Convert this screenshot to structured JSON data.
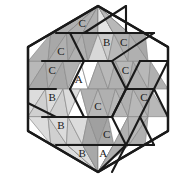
{
  "figure": {
    "name": "hexagon-triangular-tiling",
    "background": "#ffffff",
    "outline_color": "#1a1a1a",
    "grid_line_color": "#8a8a8a",
    "label_color": "#1a1a1a"
  },
  "palette": {
    "white": "#ffffff",
    "very_light": "#f0f0f0",
    "light": "#dcdcdc",
    "light_mid": "#d0d0d0",
    "mid": "#bcbcbc",
    "mid_dark": "#b0b0b0",
    "dark": "#a0a0a0"
  },
  "geometry": {
    "center_x": 98,
    "center_y": 89,
    "half_width": 84,
    "half_height": 83,
    "rows": 6,
    "row_height": 27.6667,
    "cell_half_width": 14,
    "row_triangle_counts": [
      6,
      8,
      10,
      10,
      8,
      6
    ]
  },
  "hexagon_outline": "98,6 168,47 168,131 98,172 28,131 28,47",
  "triangles": [
    {
      "id": "r0c0",
      "row": 0,
      "col": 0,
      "dir": "up",
      "fill": "#b0b0b0",
      "label": ""
    },
    {
      "id": "r0c1",
      "row": 0,
      "col": 1,
      "dir": "down",
      "fill": "#a8a8a8",
      "label": ""
    },
    {
      "id": "r0c2",
      "row": 0,
      "col": 2,
      "dir": "up",
      "fill": "#b0b0b0",
      "label": "C"
    },
    {
      "id": "r0c3",
      "row": 0,
      "col": 3,
      "dir": "down",
      "fill": "#a8a8a8",
      "label": ""
    },
    {
      "id": "r0c4",
      "row": 0,
      "col": 4,
      "dir": "up",
      "fill": "#b0b0b0",
      "label": ""
    },
    {
      "id": "r0c5",
      "row": 0,
      "col": 5,
      "dir": "down",
      "fill": "#d8d8d8",
      "label": ""
    },
    {
      "id": "r0c6",
      "row": 0,
      "col": 6,
      "dir": "up",
      "fill": "#e4e4e4",
      "label": ""
    },
    {
      "id": "r0c7",
      "row": 0,
      "col": 7,
      "dir": "down",
      "fill": "#cccccc",
      "label": ""
    },
    {
      "id": "r0c8",
      "row": 0,
      "col": 8,
      "dir": "up",
      "fill": "#b8b8b8",
      "label": ""
    },
    {
      "id": "r0c9",
      "row": 0,
      "col": 9,
      "dir": "down",
      "fill": "#b0b0b0",
      "label": ""
    },
    {
      "id": "r1c0",
      "row": 1,
      "col": 0,
      "dir": "up",
      "fill": "#b0b0b0",
      "label": ""
    },
    {
      "id": "r1c1",
      "row": 1,
      "col": 1,
      "dir": "down",
      "fill": "#a8a8a8",
      "label": ""
    },
    {
      "id": "r1c2",
      "row": 1,
      "col": 2,
      "dir": "up",
      "fill": "#b0b0b0",
      "label": "C"
    },
    {
      "id": "r1c3",
      "row": 1,
      "col": 3,
      "dir": "down",
      "fill": "#a8a8a8",
      "label": ""
    },
    {
      "id": "r1c4",
      "row": 1,
      "col": 4,
      "dir": "up",
      "fill": "#b0b0b0",
      "label": ""
    },
    {
      "id": "r1c5",
      "row": 1,
      "col": 5,
      "dir": "down",
      "fill": "#a8a8a8",
      "label": ""
    },
    {
      "id": "r1c6",
      "row": 1,
      "col": 6,
      "dir": "up",
      "fill": "#d8d8d8",
      "label": ""
    },
    {
      "id": "r1c7",
      "row": 1,
      "col": 7,
      "dir": "down",
      "fill": "#cccccc",
      "label": "B"
    },
    {
      "id": "r1c8",
      "row": 1,
      "col": 8,
      "dir": "up",
      "fill": "#b8b8b8",
      "label": ""
    },
    {
      "id": "r1c9",
      "row": 1,
      "col": 9,
      "dir": "down",
      "fill": "#b0b0b0",
      "label": "C"
    },
    {
      "id": "r1c10",
      "row": 1,
      "col": 10,
      "dir": "up",
      "fill": "#b0b0b0",
      "label": ""
    },
    {
      "id": "r1c11",
      "row": 1,
      "col": 11,
      "dir": "down",
      "fill": "#a8a8a8",
      "label": ""
    },
    {
      "id": "r2c0",
      "row": 2,
      "col": 0,
      "dir": "up",
      "fill": "#b8b8b8",
      "label": ""
    },
    {
      "id": "r2c1",
      "row": 2,
      "col": 1,
      "dir": "down",
      "fill": "#a8a8a8",
      "label": ""
    },
    {
      "id": "r2c2",
      "row": 2,
      "col": 2,
      "dir": "up",
      "fill": "#b0b0b0",
      "label": "C"
    },
    {
      "id": "r2c3",
      "row": 2,
      "col": 3,
      "dir": "down",
      "fill": "#a8a8a8",
      "label": ""
    },
    {
      "id": "r2c4",
      "row": 2,
      "col": 4,
      "dir": "up",
      "fill": "#b0b0b0",
      "label": ""
    },
    {
      "id": "r2c5",
      "row": 2,
      "col": 5,
      "dir": "down",
      "fill": "#ffffff",
      "label": "A"
    },
    {
      "id": "r2c6",
      "row": 2,
      "col": 6,
      "dir": "up",
      "fill": "#ffffff",
      "label": ""
    },
    {
      "id": "r2c7",
      "row": 2,
      "col": 7,
      "dir": "down",
      "fill": "#b0b0b0",
      "label": ""
    },
    {
      "id": "r2c8",
      "row": 2,
      "col": 8,
      "dir": "up",
      "fill": "#b8b8b8",
      "label": ""
    },
    {
      "id": "r2c9",
      "row": 2,
      "col": 9,
      "dir": "down",
      "fill": "#b0b0b0",
      "label": ""
    },
    {
      "id": "r2c10",
      "row": 2,
      "col": 10,
      "dir": "up",
      "fill": "#b8b8b8",
      "label": "C"
    },
    {
      "id": "r2c11",
      "row": 2,
      "col": 11,
      "dir": "down",
      "fill": "#b0b0b0",
      "label": ""
    },
    {
      "id": "r2c12",
      "row": 2,
      "col": 12,
      "dir": "up",
      "fill": "#b8b8b8",
      "label": ""
    },
    {
      "id": "r2c13",
      "row": 2,
      "col": 13,
      "dir": "down",
      "fill": "#b0b0b0",
      "label": ""
    },
    {
      "id": "r3c0",
      "row": 3,
      "col": 0,
      "dir": "up",
      "fill": "#dcdcdc",
      "label": ""
    },
    {
      "id": "r3c1",
      "row": 3,
      "col": 1,
      "dir": "down",
      "fill": "#d0d0d0",
      "label": ""
    },
    {
      "id": "r3c2",
      "row": 3,
      "col": 2,
      "dir": "up",
      "fill": "#dcdcdc",
      "label": "B"
    },
    {
      "id": "r3c3",
      "row": 3,
      "col": 3,
      "dir": "down",
      "fill": "#d0d0d0",
      "label": ""
    },
    {
      "id": "r3c4",
      "row": 3,
      "col": 4,
      "dir": "up",
      "fill": "#dcdcdc",
      "label": ""
    },
    {
      "id": "r3c5",
      "row": 3,
      "col": 5,
      "dir": "down",
      "fill": "#ffffff",
      "label": ""
    },
    {
      "id": "r3c6",
      "row": 3,
      "col": 6,
      "dir": "up",
      "fill": "#b0b0b0",
      "label": ""
    },
    {
      "id": "r3c7",
      "row": 3,
      "col": 7,
      "dir": "down",
      "fill": "#b8b8b8",
      "label": "C"
    },
    {
      "id": "r3c8",
      "row": 3,
      "col": 8,
      "dir": "up",
      "fill": "#b0b0b0",
      "label": ""
    },
    {
      "id": "r3c9",
      "row": 3,
      "col": 9,
      "dir": "down",
      "fill": "#b8b8b8",
      "label": ""
    },
    {
      "id": "r3c10",
      "row": 3,
      "col": 10,
      "dir": "up",
      "fill": "#b0b0b0",
      "label": ""
    },
    {
      "id": "r3c11",
      "row": 3,
      "col": 11,
      "dir": "down",
      "fill": "#b8b8b8",
      "label": ""
    },
    {
      "id": "r3c12",
      "row": 3,
      "col": 12,
      "dir": "up",
      "fill": "#b0b0b0",
      "label": "C"
    },
    {
      "id": "r3c13",
      "row": 3,
      "col": 13,
      "dir": "down",
      "fill": "#b8b8b8",
      "label": ""
    },
    {
      "id": "r4c0",
      "row": 4,
      "col": 0,
      "dir": "up",
      "fill": "#dcdcdc",
      "label": ""
    },
    {
      "id": "r4c1",
      "row": 4,
      "col": 1,
      "dir": "down",
      "fill": "#d0d0d0",
      "label": ""
    },
    {
      "id": "r4c2",
      "row": 4,
      "col": 2,
      "dir": "up",
      "fill": "#dcdcdc",
      "label": "B"
    },
    {
      "id": "r4c3",
      "row": 4,
      "col": 3,
      "dir": "down",
      "fill": "#d0d0d0",
      "label": ""
    },
    {
      "id": "r4c4",
      "row": 4,
      "col": 4,
      "dir": "up",
      "fill": "#dcdcdc",
      "label": ""
    },
    {
      "id": "r4c5",
      "row": 4,
      "col": 5,
      "dir": "down",
      "fill": "#a8a8a8",
      "label": ""
    },
    {
      "id": "r4c6",
      "row": 4,
      "col": 6,
      "dir": "up",
      "fill": "#a0a0a0",
      "label": ""
    },
    {
      "id": "r4c7",
      "row": 4,
      "col": 7,
      "dir": "down",
      "fill": "#a8a8a8",
      "label": "C"
    },
    {
      "id": "r4c8",
      "row": 4,
      "col": 8,
      "dir": "up",
      "fill": "#ffffff",
      "label": ""
    },
    {
      "id": "r4c9",
      "row": 4,
      "col": 9,
      "dir": "down",
      "fill": "#b0b0b0",
      "label": ""
    },
    {
      "id": "r4c10",
      "row": 4,
      "col": 10,
      "dir": "up",
      "fill": "#b8b8b8",
      "label": ""
    },
    {
      "id": "r4c11",
      "row": 4,
      "col": 11,
      "dir": "down",
      "fill": "#b0b0b0",
      "label": ""
    },
    {
      "id": "r5c0",
      "row": 5,
      "col": 0,
      "dir": "up",
      "fill": "#dcdcdc",
      "label": ""
    },
    {
      "id": "r5c1",
      "row": 5,
      "col": 1,
      "dir": "down",
      "fill": "#d0d0d0",
      "label": ""
    },
    {
      "id": "r5c2",
      "row": 5,
      "col": 2,
      "dir": "up",
      "fill": "#dcdcdc",
      "label": "B"
    },
    {
      "id": "r5c3",
      "row": 5,
      "col": 3,
      "dir": "down",
      "fill": "#d0d0d0",
      "label": ""
    },
    {
      "id": "r5c4",
      "row": 5,
      "col": 4,
      "dir": "up",
      "fill": "#a8a8a8",
      "label": ""
    },
    {
      "id": "r5c5",
      "row": 5,
      "col": 5,
      "dir": "down",
      "fill": "#a0a0a0",
      "label": ""
    },
    {
      "id": "r5c6",
      "row": 5,
      "col": 6,
      "dir": "up",
      "fill": "#ffffff",
      "label": "A"
    },
    {
      "id": "r5c7",
      "row": 5,
      "col": 7,
      "dir": "down",
      "fill": "#ffffff",
      "label": ""
    },
    {
      "id": "r5c8",
      "row": 5,
      "col": 8,
      "dir": "up",
      "fill": "#b0b0b0",
      "label": ""
    },
    {
      "id": "r5c9",
      "row": 5,
      "col": 9,
      "dir": "down",
      "fill": "#b8b8b8",
      "label": ""
    }
  ],
  "bold_edges": [
    {
      "id": "be01",
      "from": [
        98,
        6
      ],
      "to": [
        168,
        47
      ]
    },
    {
      "id": "be02",
      "from": [
        168,
        47
      ],
      "to": [
        168,
        131
      ]
    },
    {
      "id": "be03",
      "from": [
        168,
        131
      ],
      "to": [
        98,
        172
      ]
    },
    {
      "id": "be04",
      "from": [
        98,
        172
      ],
      "to": [
        28,
        131
      ]
    },
    {
      "id": "be05",
      "from": [
        28,
        131
      ],
      "to": [
        28,
        47
      ]
    },
    {
      "id": "be06",
      "from": [
        28,
        47
      ],
      "to": [
        98,
        6
      ]
    },
    {
      "id": "be10",
      "from": [
        56,
        33
      ],
      "to": [
        126,
        33
      ]
    },
    {
      "id": "be11",
      "from": [
        42,
        61
      ],
      "to": [
        112,
        61
      ]
    },
    {
      "id": "be12",
      "from": [
        28,
        89
      ],
      "to": [
        56,
        89
      ]
    },
    {
      "id": "be13",
      "from": [
        28,
        103
      ],
      "to": [
        28,
        47
      ]
    },
    {
      "id": "be20",
      "from": [
        126,
        6
      ],
      "to": [
        84,
        33
      ]
    },
    {
      "id": "be21",
      "from": [
        126,
        33
      ],
      "to": [
        126,
        6
      ]
    },
    {
      "id": "be22",
      "from": [
        112,
        61
      ],
      "to": [
        154,
        33
      ]
    },
    {
      "id": "be23",
      "from": [
        126,
        33
      ],
      "to": [
        154,
        33
      ]
    },
    {
      "id": "be30",
      "from": [
        112,
        61
      ],
      "to": [
        84,
        61
      ]
    },
    {
      "id": "be31",
      "from": [
        84,
        61
      ],
      "to": [
        70,
        89
      ]
    },
    {
      "id": "be32",
      "from": [
        70,
        89
      ],
      "to": [
        84,
        117
      ]
    },
    {
      "id": "be33",
      "from": [
        84,
        117
      ],
      "to": [
        112,
        117
      ]
    },
    {
      "id": "be34",
      "from": [
        112,
        117
      ],
      "to": [
        126,
        89
      ]
    },
    {
      "id": "be35",
      "from": [
        126,
        89
      ],
      "to": [
        112,
        61
      ]
    },
    {
      "id": "be40",
      "from": [
        140,
        61
      ],
      "to": [
        168,
        61
      ]
    },
    {
      "id": "be41",
      "from": [
        126,
        89
      ],
      "to": [
        154,
        89
      ]
    },
    {
      "id": "be42",
      "from": [
        154,
        89
      ],
      "to": [
        168,
        61
      ]
    },
    {
      "id": "be43",
      "from": [
        140,
        61
      ],
      "to": [
        126,
        89
      ]
    },
    {
      "id": "be44",
      "from": [
        154,
        89
      ],
      "to": [
        168,
        117
      ]
    },
    {
      "id": "be45",
      "from": [
        154,
        89
      ],
      "to": [
        140,
        117
      ]
    },
    {
      "id": "be46",
      "from": [
        140,
        117
      ],
      "to": [
        126,
        145
      ]
    },
    {
      "id": "be47",
      "from": [
        126,
        145
      ],
      "to": [
        112,
        117
      ]
    },
    {
      "id": "be48",
      "from": [
        112,
        117
      ],
      "to": [
        126,
        89
      ]
    },
    {
      "id": "be49",
      "from": [
        126,
        145
      ],
      "to": [
        112,
        172
      ]
    },
    {
      "id": "be50",
      "from": [
        140,
        117
      ],
      "to": [
        154,
        145
      ]
    },
    {
      "id": "be51",
      "from": [
        154,
        145
      ],
      "to": [
        126,
        145
      ]
    },
    {
      "id": "be60",
      "from": [
        28,
        103
      ],
      "to": [
        56,
        117
      ]
    },
    {
      "id": "be61",
      "from": [
        42,
        117
      ],
      "to": [
        112,
        117
      ]
    },
    {
      "id": "be62",
      "from": [
        56,
        145
      ],
      "to": [
        126,
        145
      ]
    },
    {
      "id": "be63",
      "from": [
        84,
        61
      ],
      "to": [
        70,
        33
      ]
    },
    {
      "id": "be64",
      "from": [
        98,
        172
      ],
      "to": [
        126,
        145
      ]
    }
  ],
  "labels": [
    {
      "text": "C",
      "x": 70,
      "y": 24
    },
    {
      "text": "C",
      "x": 56,
      "y": 52
    },
    {
      "text": "C",
      "x": 42,
      "y": 80
    },
    {
      "text": "B",
      "x": 56,
      "y": 108
    },
    {
      "text": "B",
      "x": 70,
      "y": 135
    },
    {
      "text": "B",
      "x": 84,
      "y": 163
    },
    {
      "text": "A",
      "x": 98,
      "y": 80
    },
    {
      "text": "B",
      "x": 112,
      "y": 52
    },
    {
      "text": "C",
      "x": 140,
      "y": 52
    },
    {
      "text": "C",
      "x": 126,
      "y": 107
    },
    {
      "text": "C",
      "x": 112,
      "y": 135
    },
    {
      "text": "C",
      "x": 154,
      "y": 80
    },
    {
      "text": "C",
      "x": 168,
      "y": 107
    },
    {
      "text": "A",
      "x": 140,
      "y": 163
    }
  ],
  "legend": {
    "label_a": "A",
    "label_b": "B",
    "label_c": "C"
  }
}
